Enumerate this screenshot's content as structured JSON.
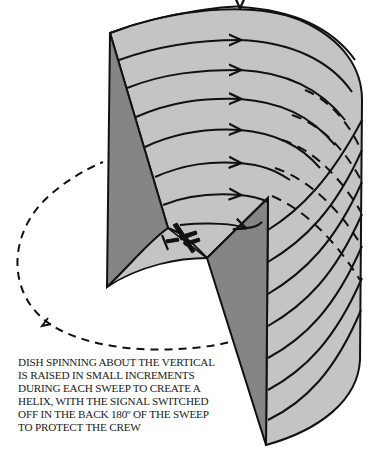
{
  "diagram": {
    "colors": {
      "surface": "#c4c4c4",
      "panel": "#858585",
      "line": "#111111",
      "background": "#ffffff"
    },
    "elements": {
      "cylinder": "scanned helical surface",
      "left_panel": "vertical cut face (left)",
      "right_panel": "vertical cut face (right)",
      "aircraft": "aircraft icon",
      "dashed_path": "back 180 degrees of sweep (signal off)"
    }
  },
  "caption": {
    "lines": [
      "DISH SPINNING ABOUT THE VERTICAL",
      "IS RAISED IN SMALL INCREMENTS",
      "DURING EACH SWEEP TO CREATE A",
      "HELIX, WITH THE SIGNAL SWITCHED",
      "OFF IN THE BACK 180º OF THE SWEEP",
      "TO PROTECT THE CREW"
    ]
  }
}
